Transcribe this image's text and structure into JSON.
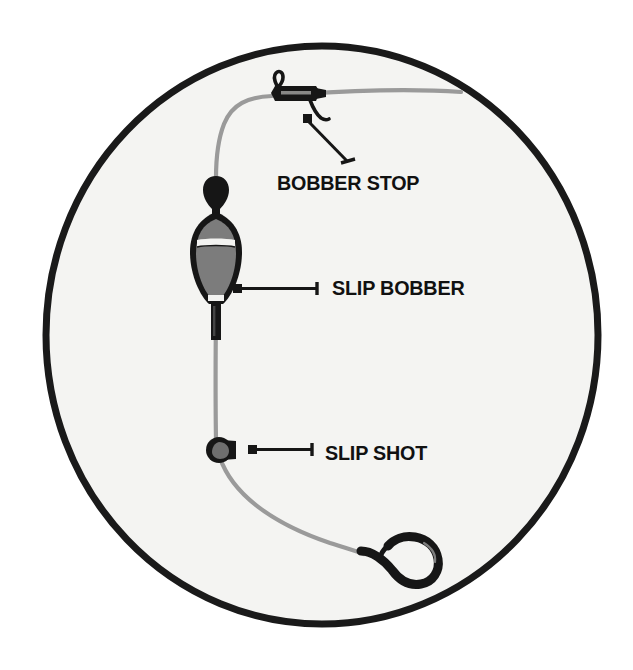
{
  "illustration": {
    "title": "Slip Bobber Fishing Rig Diagram",
    "background_color": "#ffffff",
    "circle": {
      "name": "circular-frame",
      "center_x": 322,
      "center_y": 335,
      "radius_x": 277,
      "radius_y": 290,
      "fill_color": "#f4f4f2",
      "stroke_color": "#1a1a1a",
      "stroke_width": 7
    },
    "palette": {
      "line_gray": "#9a9a9a",
      "tackle_black": "#161616",
      "bobber_body_gray": "#7c7c7c",
      "bobber_highlight": "#f2f2f0",
      "label_text": "#111111"
    }
  },
  "callouts": [
    {
      "id": "bobber-stop",
      "label": "BOBBER STOP",
      "marker": {
        "x": 307,
        "y": 118
      },
      "leader_end": {
        "x": 350,
        "y": 165
      },
      "part_position": {
        "x": 290,
        "y": 95
      }
    },
    {
      "id": "slip-bobber",
      "label": "SLIP BOBBER",
      "marker": {
        "x": 237,
        "y": 288
      },
      "leader_end": {
        "x": 318,
        "y": 288
      },
      "part_position": {
        "x": 215,
        "y": 250
      }
    },
    {
      "id": "slip-shot",
      "label": "SLIP SHOT",
      "marker": {
        "x": 252,
        "y": 450
      },
      "leader_end": {
        "x": 313,
        "y": 450
      },
      "part_position": {
        "x": 220,
        "y": 450
      }
    }
  ],
  "parts": [
    {
      "name": "fishing-line",
      "description": "Monofilament main line running from upper right, around through the rig, down to the hook"
    },
    {
      "name": "bobber-stop-knot",
      "description": "Black bobber stop knot with tag ends on the main line"
    },
    {
      "name": "slip-bobber-float",
      "description": "Gray and black tapered slip float with white band"
    },
    {
      "name": "slip-shot-sinker",
      "description": "Round split shot weight pinched onto the line"
    },
    {
      "name": "fishing-hook",
      "description": "Black J-style bait hook at the line terminus"
    }
  ]
}
